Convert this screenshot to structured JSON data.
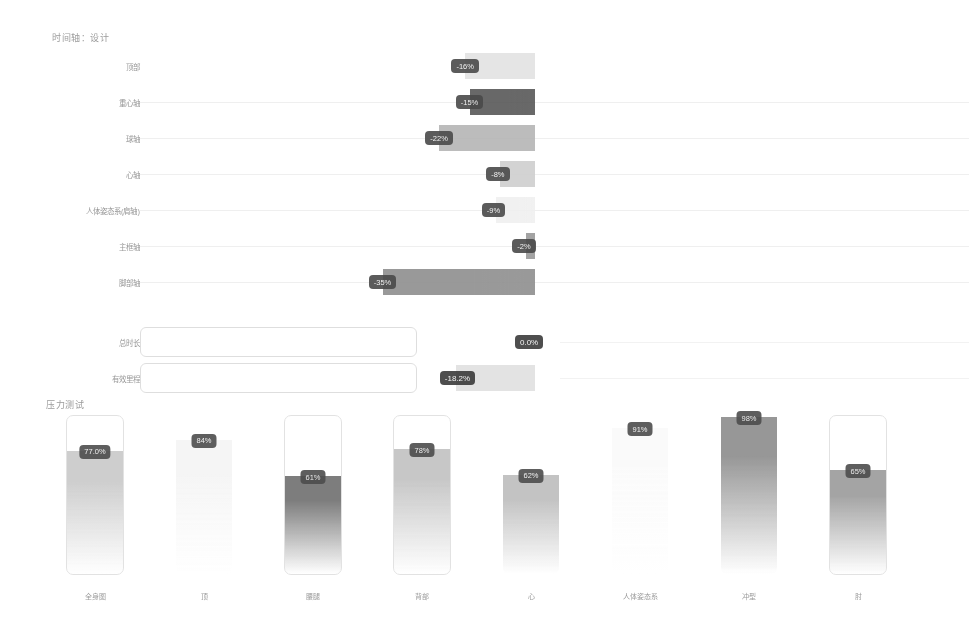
{
  "sections": {
    "top_title": "时间轴：设计",
    "bottom_title": "压力测试",
    "baseline_x": 535
  },
  "chart_data": [
    {
      "type": "bar",
      "orientation": "horizontal",
      "title": "时间轴：设计",
      "xlabel": "",
      "ylabel": "",
      "grid": true,
      "baseline": 0,
      "categories": [
        "顶部",
        "重心轴",
        "球轴",
        "心轴",
        "人体姿态系(肩轴)",
        "主框轴",
        "脚部轴"
      ],
      "values": [
        -16,
        -15,
        -22,
        -8,
        -9,
        -2,
        -35
      ],
      "labels": [
        "-16%",
        "-15%",
        "-22%",
        "-8%",
        "-9%",
        "-2%",
        "-35%"
      ],
      "bar_colors": [
        "#e3e3e3",
        "#585858",
        "#b5b5b5",
        "#cfcfcf",
        "#f0f0f0",
        "#9a9a9a",
        "#8f8f8f"
      ]
    },
    {
      "type": "bar",
      "orientation": "horizontal",
      "title": "",
      "categories": [
        "总时长",
        "有效里程"
      ],
      "values": [
        0.0,
        -18.2
      ],
      "labels": [
        "0.0%",
        "-18.2%"
      ],
      "bar_colors": [
        "#ffffff",
        "#e0e0e0"
      ]
    },
    {
      "type": "bar",
      "orientation": "vertical",
      "title": "压力测试",
      "xlabel": "",
      "ylabel": "",
      "ylim": [
        0,
        100
      ],
      "categories": [
        "全身图",
        "顶",
        "腰腿",
        "背部",
        "心",
        "人体姿态系",
        "冲型",
        "肘"
      ],
      "values": [
        77.0,
        84,
        61,
        78,
        62,
        91,
        98,
        65
      ],
      "labels": [
        "77.0%",
        "84%",
        "61%",
        "78%",
        "62%",
        "91%",
        "98%",
        "65%"
      ],
      "bar_colors": [
        "#c9c9c9",
        "#f4f4f4",
        "#6f6f6f",
        "#c2c2c2",
        "#bdbdbd",
        "#fafafa",
        "#8c8c8c",
        "#9b9b9b"
      ],
      "frame_visible": [
        true,
        false,
        true,
        true,
        false,
        false,
        false,
        true
      ]
    }
  ],
  "colors": {
    "label_chip_bg": "#4a4a4a",
    "label_chip_text": "#f2f2f2",
    "gridline": "#e9e9e9",
    "frame_border": "#dcdcdc",
    "text": "#7d7d7d"
  }
}
